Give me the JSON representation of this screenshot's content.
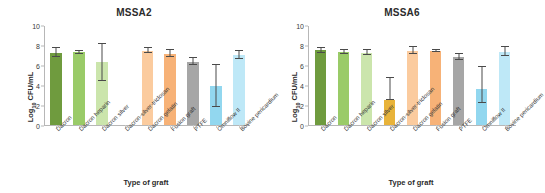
{
  "chart_data": [
    {
      "type": "bar",
      "title": "MSSA2",
      "xlabel": "Type of graft",
      "ylabel": "Log10 CFU/mL",
      "ylim": [
        0,
        10
      ],
      "yticks": [
        0,
        2,
        4,
        6,
        8,
        10
      ],
      "grid": false,
      "legend": "none",
      "categories": [
        "Dacron",
        "Dacron heparin",
        "Dacron silver",
        "Dacron-silver-triclosan",
        "Dacron gelatin",
        "Fusion graft",
        "PTFE",
        "Omniflow II",
        "Bovine pericardium"
      ],
      "values": [
        7.25,
        7.35,
        6.35,
        0,
        7.5,
        7.2,
        6.4,
        3.9,
        7.05
      ],
      "err_low": [
        6.85,
        7.2,
        4.45,
        0,
        7.25,
        6.85,
        6.05,
        1.8,
        6.7
      ],
      "err_high": [
        7.75,
        7.5,
        8.15,
        0,
        7.8,
        7.55,
        6.75,
        6.1,
        7.5
      ],
      "colors": [
        "#6f9b3e",
        "#9acb68",
        "#cbe5ac",
        "#e8b33a",
        "#fbcb9e",
        "#f7b277",
        "#a6a6a6",
        "#92d7ef",
        "#bee8f7"
      ]
    },
    {
      "type": "bar",
      "title": "MSSA6",
      "xlabel": "Type of graft",
      "ylabel": "Log10 CFU/mL",
      "ylim": [
        0,
        10
      ],
      "yticks": [
        0,
        2,
        4,
        6,
        8,
        10
      ],
      "grid": false,
      "legend": "none",
      "categories": [
        "Dacron",
        "Dacron heparin",
        "Dacron silver",
        "Dacron-silver-triclosan",
        "Dacron gelatin",
        "Fusion graft",
        "PTFE",
        "Omniflow II",
        "Bovine pericardium"
      ],
      "values": [
        7.55,
        7.35,
        7.3,
        2.5,
        7.5,
        7.5,
        6.85,
        3.65,
        7.35
      ],
      "err_low": [
        7.25,
        7.15,
        7.1,
        2.5,
        7.2,
        7.35,
        6.6,
        2.2,
        6.95
      ],
      "err_high": [
        7.8,
        7.55,
        7.55,
        4.7,
        7.85,
        7.6,
        7.15,
        5.9,
        7.85
      ],
      "colors": [
        "#6f9b3e",
        "#9acb68",
        "#cbe5ac",
        "#e8b33a",
        "#fbcb9e",
        "#f7b277",
        "#a6a6a6",
        "#92d7ef",
        "#bee8f7"
      ]
    }
  ]
}
